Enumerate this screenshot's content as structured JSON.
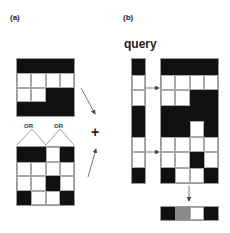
{
  "panels": {
    "a": {
      "label": "(a)"
    },
    "b": {
      "label": "(b)"
    }
  },
  "query_label": "query",
  "or_labels": [
    "OR",
    "OR"
  ],
  "plus_symbol": "+",
  "grids": {
    "top_left": {
      "rows": 4,
      "cols": 4,
      "cells": [
        [
          "B",
          "B",
          "B",
          "B"
        ],
        [
          "W",
          "W",
          "W",
          "W"
        ],
        [
          "W",
          "W",
          "B",
          "B"
        ],
        [
          "B",
          "B",
          "B",
          "B"
        ]
      ]
    },
    "bottom_left": {
      "rows": 4,
      "cols": 4,
      "cells": [
        [
          "B",
          "B",
          "W",
          "B"
        ],
        [
          "W",
          "W",
          "W",
          "W"
        ],
        [
          "W",
          "W",
          "B",
          "W"
        ],
        [
          "B",
          "W",
          "W",
          "B"
        ]
      ]
    },
    "query_column": {
      "rows": 8,
      "cols": 1,
      "cells": [
        [
          "B"
        ],
        [
          "W"
        ],
        [
          "W"
        ],
        [
          "B"
        ],
        [
          "B"
        ],
        [
          "W"
        ],
        [
          "W"
        ],
        [
          "B"
        ]
      ]
    },
    "right_combined": {
      "rows": 8,
      "cols": 4,
      "cells": [
        [
          "B",
          "B",
          "B",
          "B"
        ],
        [
          "W",
          "W",
          "W",
          "W"
        ],
        [
          "W",
          "W",
          "B",
          "B"
        ],
        [
          "B",
          "B",
          "B",
          "B"
        ],
        [
          "B",
          "B",
          "W",
          "B"
        ],
        [
          "W",
          "W",
          "W",
          "W"
        ],
        [
          "W",
          "W",
          "B",
          "W"
        ],
        [
          "B",
          "W",
          "W",
          "B"
        ]
      ]
    },
    "output_strip": {
      "rows": 1,
      "cols": 4,
      "cells": [
        [
          "B",
          "G",
          "W",
          "B"
        ]
      ]
    }
  },
  "colors": {
    "black": "#111111",
    "gray": "#8a8a8a",
    "white": "#ffffff",
    "line": "#555555"
  }
}
